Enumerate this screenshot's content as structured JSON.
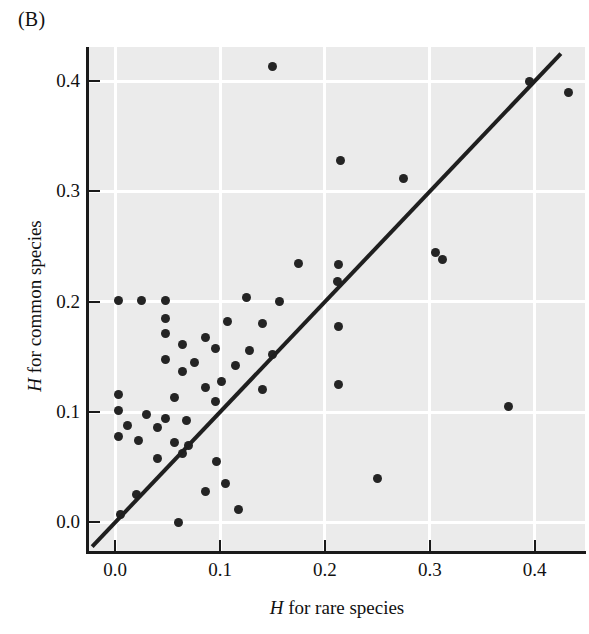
{
  "panel": {
    "label": "(B)"
  },
  "axes": {
    "x_title_italic": "H",
    "x_title_rest": " for rare species",
    "y_title_italic": "H",
    "y_title_rest": " for common species",
    "x_ticks": [
      "0.0",
      "0.1",
      "0.2",
      "0.3",
      "0.4"
    ],
    "y_ticks": [
      "0.0",
      "0.1",
      "0.2",
      "0.3",
      "0.4"
    ]
  },
  "style": {
    "plot_background": "#ebebeb",
    "gridline_color": "#ffffff",
    "point_color": "#242424",
    "line_color": "#1f1f1f",
    "axis_color": "#1a1a1a"
  },
  "chart_data": {
    "type": "scatter",
    "title": "(B)",
    "xlabel": "H for rare species",
    "ylabel": "H for common species",
    "xlim": [
      -0.025,
      0.448
    ],
    "ylim": [
      -0.026,
      0.431
    ],
    "xticks": [
      0.0,
      0.1,
      0.2,
      0.3,
      0.4
    ],
    "yticks": [
      0.0,
      0.1,
      0.2,
      0.3,
      0.4
    ],
    "grid": true,
    "legend": null,
    "reference_line": {
      "name": "1:1 line",
      "slope": 1,
      "intercept": 0,
      "x_start": -0.022,
      "x_end": 0.425
    },
    "points": [
      [
        0.15,
        0.413
      ],
      [
        0.395,
        0.4
      ],
      [
        0.432,
        0.39
      ],
      [
        0.215,
        0.328
      ],
      [
        0.275,
        0.312
      ],
      [
        0.305,
        0.245
      ],
      [
        0.312,
        0.238
      ],
      [
        0.175,
        0.235
      ],
      [
        0.213,
        0.234
      ],
      [
        0.212,
        0.218
      ],
      [
        0.003,
        0.201
      ],
      [
        0.025,
        0.201
      ],
      [
        0.048,
        0.201
      ],
      [
        0.125,
        0.204
      ],
      [
        0.157,
        0.2
      ],
      [
        0.048,
        0.185
      ],
      [
        0.107,
        0.182
      ],
      [
        0.14,
        0.18
      ],
      [
        0.213,
        0.178
      ],
      [
        0.048,
        0.171
      ],
      [
        0.086,
        0.168
      ],
      [
        0.064,
        0.161
      ],
      [
        0.096,
        0.158
      ],
      [
        0.128,
        0.156
      ],
      [
        0.15,
        0.152
      ],
      [
        0.048,
        0.148
      ],
      [
        0.076,
        0.145
      ],
      [
        0.115,
        0.142
      ],
      [
        0.064,
        0.137
      ],
      [
        0.101,
        0.128
      ],
      [
        0.213,
        0.125
      ],
      [
        0.086,
        0.122
      ],
      [
        0.14,
        0.12
      ],
      [
        0.003,
        0.116
      ],
      [
        0.057,
        0.113
      ],
      [
        0.096,
        0.11
      ],
      [
        0.375,
        0.105
      ],
      [
        0.003,
        0.101
      ],
      [
        0.03,
        0.098
      ],
      [
        0.048,
        0.094
      ],
      [
        0.068,
        0.092
      ],
      [
        0.012,
        0.088
      ],
      [
        0.04,
        0.086
      ],
      [
        0.003,
        0.078
      ],
      [
        0.022,
        0.074
      ],
      [
        0.057,
        0.072
      ],
      [
        0.07,
        0.07
      ],
      [
        0.064,
        0.062
      ],
      [
        0.04,
        0.058
      ],
      [
        0.097,
        0.055
      ],
      [
        0.25,
        0.04
      ],
      [
        0.105,
        0.035
      ],
      [
        0.086,
        0.028
      ],
      [
        0.02,
        0.025
      ],
      [
        0.118,
        0.012
      ],
      [
        0.005,
        0.007
      ],
      [
        0.06,
        0.0
      ]
    ]
  }
}
